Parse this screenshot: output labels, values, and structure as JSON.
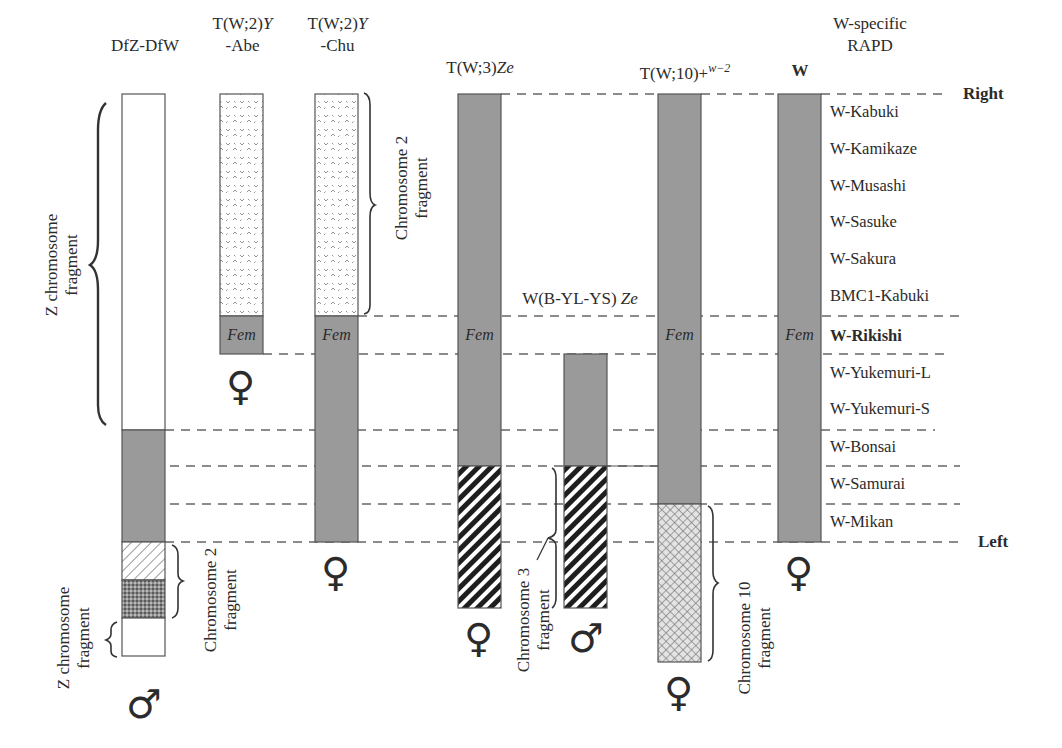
{
  "columns": [
    {
      "id": "dfz-dfw",
      "label_line1": "DfZ-DfW",
      "label_line2": "",
      "sex": "♂"
    },
    {
      "id": "t-w2-y-abe",
      "label_line1_main": "T(W;2)",
      "label_line1_ital": "Y",
      "label_line2": "-Abe",
      "sex": "♀"
    },
    {
      "id": "t-w2-y-chu",
      "label_line1_main": "T(W;2)",
      "label_line1_ital": "Y",
      "label_line2": "-Chu",
      "sex": "♀"
    },
    {
      "id": "t-w3-ze",
      "label_main": "T(W;3)",
      "label_ital": "Ze",
      "sex": "♀"
    },
    {
      "id": "w-b-yl-ys-ze",
      "label_main": "W(B-YL-YS) ",
      "label_ital": "Ze",
      "sex": "♂"
    },
    {
      "id": "t-w10",
      "label_main": "T(W;10)+",
      "label_sup": "w−2",
      "sex": "♀"
    },
    {
      "id": "w",
      "label": "W",
      "sex": "♀"
    }
  ],
  "fem_label": "Fem",
  "markers_header": [
    "W-specific",
    "RAPD"
  ],
  "markers": [
    {
      "name": "W-Kabuki",
      "bold": false
    },
    {
      "name": "W-Kamikaze",
      "bold": false
    },
    {
      "name": "W-Musashi",
      "bold": false
    },
    {
      "name": "W-Sasuke",
      "bold": false
    },
    {
      "name": "W-Sakura",
      "bold": false
    },
    {
      "name": "BMC1-Kabuki",
      "bold": false
    },
    {
      "name": "W-Rikishi",
      "bold": true
    },
    {
      "name": "W-Yukemuri-L",
      "bold": false
    },
    {
      "name": "W-Yukemuri-S",
      "bold": false
    },
    {
      "name": "W-Bonsai",
      "bold": false
    },
    {
      "name": "W-Samurai",
      "bold": false
    },
    {
      "name": "W-Mikan",
      "bold": false
    }
  ],
  "ends": {
    "right": "Right",
    "left": "Left"
  },
  "annotations": {
    "z_fragment_top": [
      "Z chromosome",
      "fragment"
    ],
    "z_fragment_bottom": [
      "Z chromosome",
      "fragment"
    ],
    "chr2_dfz": [
      "Chromosome 2",
      "fragment"
    ],
    "chr2_chu": [
      "Chromosome 2",
      "fragment"
    ],
    "chr3": [
      "Chromosome 3",
      "fragment"
    ],
    "chr10": [
      "Chromosome 10",
      "fragment"
    ]
  },
  "colors": {
    "w_chromatin": "#9a9a9a",
    "outline": "#555555",
    "dash": "#666666",
    "text": "#2b2b2b"
  }
}
